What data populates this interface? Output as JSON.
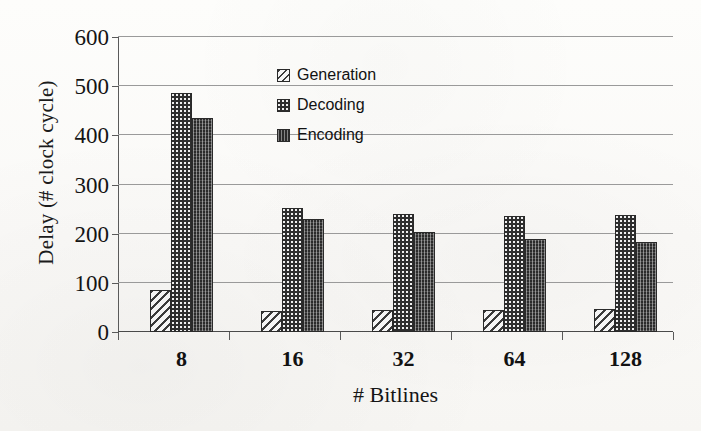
{
  "chart_data": {
    "type": "bar",
    "title": "",
    "subtitle": "",
    "xlabel": "# Bitlines",
    "ylabel": "Delay (# clock cycle)",
    "categories": [
      "8",
      "16",
      "32",
      "64",
      "128"
    ],
    "series": [
      {
        "name": "Generation",
        "values": [
          86,
          43,
          44,
          45,
          46
        ]
      },
      {
        "name": "Decoding",
        "values": [
          487,
          252,
          240,
          235,
          237
        ]
      },
      {
        "name": "Encoding",
        "values": [
          435,
          230,
          203,
          189,
          184
        ]
      }
    ],
    "ylim": [
      0,
      600
    ],
    "ytick_values": [
      0,
      100,
      200,
      300,
      400,
      500,
      600
    ],
    "ytick_labels": [
      "0",
      "100",
      "200",
      "300",
      "400",
      "500",
      "600"
    ],
    "grid": true,
    "grid_axis": "y",
    "legend_position": "upper-center-left-inside",
    "legend_entries": [
      "Generation",
      "Decoding",
      "Encoding"
    ],
    "annotations": []
  },
  "colors": {
    "background": "#fbfbf9",
    "axis": "#5a5a5a",
    "gridline": "#9a9a9a",
    "text": "#141414",
    "generation_fill": "#f2f2f2",
    "decoding_fill": "#efefef",
    "encoding_fill": "#2b2b2b",
    "bar_outline": "#2a2a2a"
  }
}
